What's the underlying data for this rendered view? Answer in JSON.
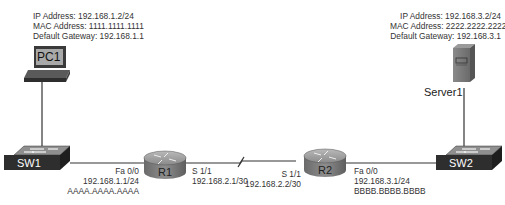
{
  "pc1": {
    "label": "PC1",
    "ip": "IP Address: 192.168.1.2/24",
    "mac": "MAC Address: 1111.1111.1111",
    "gateway": "Default Gateway: 192.168.1.1"
  },
  "server1": {
    "label": "Server1",
    "ip": "IP Address: 192.168.3.2/24",
    "mac": "MAC Address: 2222.2222.2222",
    "gateway": "Default Gateway: 192.168.3.1"
  },
  "sw1": {
    "label": "SW1"
  },
  "sw2": {
    "label": "SW2"
  },
  "r1": {
    "label": "R1",
    "fa_if": "Fa 0/0",
    "fa_ip": "192.168.1.1/24",
    "fa_mac": "AAAA.AAAA.AAAA",
    "s_if": "S 1/1",
    "s_ip": "192.168.2.1/30"
  },
  "r2": {
    "label": "R2",
    "s_if": "S 1/1",
    "s_ip": "192.168.2.2/30",
    "fa_if": "Fa 0/0",
    "fa_ip": "192.168.3.1/24",
    "fa_mac": "BBBB.BBBB.BBBB"
  },
  "colors": {
    "device_dark": "#3a3a3a",
    "device_mid": "#7a7a7a",
    "device_light": "#a8a8a8",
    "line": "#333333"
  }
}
